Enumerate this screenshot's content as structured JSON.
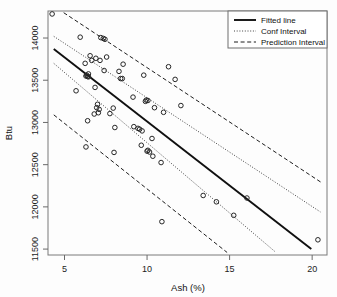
{
  "chart_data": {
    "type": "scatter",
    "title": "",
    "xlabel": "Ash (%)",
    "ylabel": "Btu",
    "xlim": [
      4.0,
      20.9
    ],
    "ylim": [
      11430,
      14320
    ],
    "xticks": [
      5,
      10,
      15,
      20
    ],
    "xticklabels": [
      "5",
      "10",
      "15",
      "20"
    ],
    "yticks": [
      11500,
      12000,
      12500,
      13000,
      13500,
      14000
    ],
    "yticklabels": [
      "11500",
      "12000",
      "12500",
      "13000",
      "13500",
      "14000"
    ],
    "grid": false,
    "legend_position": "top-right",
    "legend": [
      {
        "label": "Fitted line",
        "style": "solid"
      },
      {
        "label": "Conf Interval",
        "style": "dotted"
      },
      {
        "label": "Prediction Interval",
        "style": "dashed"
      }
    ],
    "points": [
      [
        4.25,
        14285
      ],
      [
        5.95,
        14010
      ],
      [
        7.35,
        13995
      ],
      [
        7.45,
        13985
      ],
      [
        7.2,
        14005
      ],
      [
        6.55,
        13790
      ],
      [
        6.9,
        13760
      ],
      [
        7.55,
        13775
      ],
      [
        6.25,
        13700
      ],
      [
        7.15,
        13735
      ],
      [
        6.65,
        13735
      ],
      [
        8.55,
        13690
      ],
      [
        11.3,
        13660
      ],
      [
        7.4,
        13615
      ],
      [
        8.3,
        13605
      ],
      [
        6.45,
        13575
      ],
      [
        6.35,
        13560
      ],
      [
        6.4,
        13545
      ],
      [
        6.45,
        13540
      ],
      [
        6.3,
        13550
      ],
      [
        9.8,
        13560
      ],
      [
        8.4,
        13520
      ],
      [
        8.5,
        13520
      ],
      [
        11.7,
        13510
      ],
      [
        5.7,
        13375
      ],
      [
        6.85,
        13415
      ],
      [
        9.15,
        13300
      ],
      [
        9.95,
        13265
      ],
      [
        10.05,
        13260
      ],
      [
        9.9,
        13250
      ],
      [
        12.05,
        13200
      ],
      [
        7.0,
        13215
      ],
      [
        6.95,
        13175
      ],
      [
        7.1,
        13155
      ],
      [
        7.95,
        13170
      ],
      [
        10.45,
        13175
      ],
      [
        11.0,
        13120
      ],
      [
        6.8,
        13100
      ],
      [
        7.05,
        13115
      ],
      [
        7.75,
        13105
      ],
      [
        6.4,
        13020
      ],
      [
        8.05,
        12940
      ],
      [
        9.2,
        12950
      ],
      [
        9.45,
        12930
      ],
      [
        9.55,
        12920
      ],
      [
        9.7,
        12900
      ],
      [
        10.3,
        12810
      ],
      [
        9.65,
        12730
      ],
      [
        6.3,
        12710
      ],
      [
        8.0,
        12645
      ],
      [
        10.0,
        12660
      ],
      [
        10.05,
        12670
      ],
      [
        10.15,
        12650
      ],
      [
        10.35,
        12600
      ],
      [
        10.85,
        12525
      ],
      [
        13.4,
        12135
      ],
      [
        16.05,
        12105
      ],
      [
        14.2,
        12060
      ],
      [
        15.25,
        11900
      ],
      [
        10.9,
        11825
      ],
      [
        20.35,
        11610
      ]
    ],
    "fitted_line": {
      "x": [
        4.35,
        19.95
      ],
      "y": [
        13870,
        11500
      ]
    },
    "conf_interval_upper": {
      "x": [
        4.35,
        20.5
      ],
      "y": [
        14020,
        11940
      ]
    },
    "conf_interval_lower": {
      "x": [
        4.35,
        17.75
      ],
      "y": [
        13700,
        11470
      ]
    },
    "prediction_interval_upper": {
      "x": [
        4.95,
        20.55
      ],
      "y": [
        14300,
        12290
      ]
    },
    "prediction_interval_lower": {
      "x": [
        4.35,
        14.85
      ],
      "y": [
        13090,
        11460
      ]
    }
  }
}
